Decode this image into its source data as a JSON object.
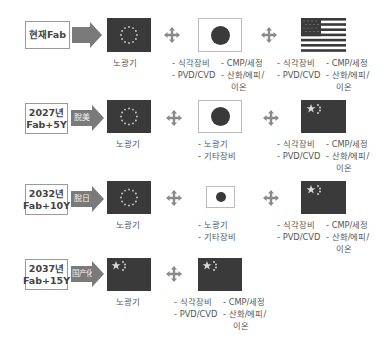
{
  "rows": [
    {
      "label_line1": "현재Fab",
      "label_line2": "",
      "arrow_text": "",
      "flag1": "eu-flag",
      "flag1_caption": "노광기",
      "flag2": "japan-flag",
      "flag2_items": [
        "- 식각장비",
        "- PVD/CVD"
      ],
      "flag2_items_col2": [
        "- CMP/세정",
        "- 산화/에피/",
        "이온"
      ],
      "flag3": "us-flag",
      "flag3_items": [
        "- 식각장비",
        "- PVD/CVD"
      ],
      "flag3_items_col2": [
        "- CMP/세정",
        "- 산화/에피/",
        "이온"
      ]
    },
    {
      "label_line1": "2027년",
      "label_line2": "Fab+5Y",
      "arrow_text": "脫美",
      "flag1": "eu-flag",
      "flag1_caption": "노광기",
      "flag2": "japan-flag",
      "flag2_items": [
        "- 노광기",
        "- 기타장비"
      ],
      "flag3": "china-flag",
      "flag3_items": [
        "- 식각장비",
        "- PVD/CVD"
      ],
      "flag3_items_col2": [
        "- CMP/세정",
        "- 산화/에피/",
        "이온"
      ]
    },
    {
      "label_line1": "2032년",
      "label_line2": "Fab+10Y",
      "arrow_text": "脫日",
      "flag1": "eu-flag",
      "flag1_caption": "노광기",
      "flag2": "japan-flag-small",
      "flag2_items": [
        "- 노광기",
        "- 기타장비"
      ],
      "flag3": "china-flag",
      "flag3_items": [
        "- 식각장비",
        "- PVD/CVD"
      ],
      "flag3_items_col2": [
        "- CMP/세정",
        "- 산화/에피/",
        "이온"
      ]
    },
    {
      "label_line1": "2037년",
      "label_line2": "Fab+15Y",
      "arrow_text": "国产化",
      "flag1": "china-flag",
      "flag1_caption": "노광기",
      "flag2": "china-flag",
      "flag2_items": [
        "- 식각장비",
        "- PVD/CVD"
      ],
      "flag2_items_col2": [
        "- CMP/세정",
        "- 산화/에피/",
        "이온"
      ]
    }
  ],
  "colors": {
    "arrow": "#7a7a7a",
    "flag_dark": "#3a3a3a",
    "border": "#9a9a9a",
    "text": "#555555"
  }
}
